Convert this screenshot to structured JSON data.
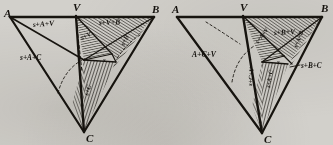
{
  "figure": {
    "caption": "",
    "ink_color": "#17140f",
    "paper_color": "#d2d0cb",
    "panel_count": 2
  },
  "left_panel": {
    "name": "left-diagram",
    "vertices": [
      {
        "key": "A",
        "label": "A",
        "x": 8,
        "y": 16
      },
      {
        "key": "V",
        "label": "V",
        "x": 76,
        "y": 11
      },
      {
        "key": "B",
        "label": "B",
        "x": 154,
        "y": 13
      },
      {
        "key": "C",
        "label": "C",
        "x": 84,
        "y": 136
      }
    ],
    "center_label": "s",
    "region_labels": [
      {
        "key": "s-A-V",
        "text": "s+A+V",
        "x": 38,
        "y": 24,
        "rotate": -4
      },
      {
        "key": "s-V-B",
        "text": "s+V+B",
        "x": 102,
        "y": 22,
        "rotate": -2
      },
      {
        "key": "s-A-C",
        "text": "s+A+C",
        "x": 24,
        "y": 57,
        "rotate": 0
      },
      {
        "key": "s-V",
        "text": "s+V",
        "x": 85,
        "y": 42,
        "rotate": -28
      },
      {
        "key": "s-B",
        "text": "s+B",
        "x": 128,
        "y": 42,
        "rotate": -62
      },
      {
        "key": "s-C",
        "text": "s+C",
        "x": 92,
        "y": 92,
        "rotate": -72
      }
    ]
  },
  "right_panel": {
    "name": "right-diagram",
    "vertices": [
      {
        "key": "A",
        "label": "A",
        "x": 175,
        "y": 14
      },
      {
        "key": "V",
        "label": "V",
        "x": 242,
        "y": 11
      },
      {
        "key": "B",
        "label": "B",
        "x": 322,
        "y": 12
      },
      {
        "key": "C",
        "label": "C",
        "x": 262,
        "y": 137
      }
    ],
    "center_label": "s",
    "region_labels": [
      {
        "key": "A-C-V",
        "text": "A+C+V",
        "x": 196,
        "y": 55,
        "rotate": 0
      },
      {
        "key": "s-B-V",
        "text": "s+B+V",
        "x": 277,
        "y": 33,
        "rotate": -3
      },
      {
        "key": "s-A-V",
        "text": "s+A+V",
        "x": 263,
        "y": 40,
        "rotate": -52
      },
      {
        "key": "s-A-B",
        "text": "s+A+B",
        "x": 300,
        "y": 44,
        "rotate": -68
      },
      {
        "key": "s-C-V",
        "text": "s+C+V",
        "x": 256,
        "y": 80,
        "rotate": -84
      },
      {
        "key": "s-A-C",
        "text": "s+A+C",
        "x": 272,
        "y": 82,
        "rotate": -80
      },
      {
        "key": "s-B-C",
        "text": "s+B+C",
        "x": 302,
        "y": 67,
        "rotate": 0
      }
    ]
  }
}
